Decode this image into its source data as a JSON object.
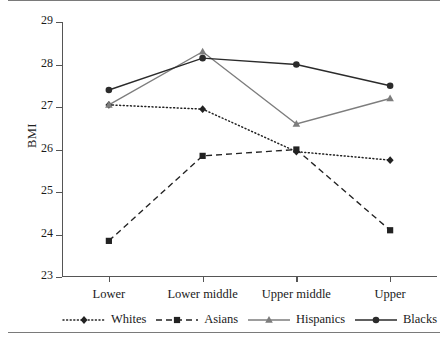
{
  "figure": {
    "ylabel": "BMI",
    "rules": [
      "top-rule",
      "bottom-rule"
    ]
  },
  "chart_data": {
    "type": "line",
    "title": "",
    "xlabel": "",
    "ylabel": "BMI",
    "categories": [
      "Lower",
      "Lower middle",
      "Upper middle",
      "Upper"
    ],
    "ylim": [
      23,
      29
    ],
    "yticks": [
      23,
      24,
      25,
      26,
      27,
      28,
      29
    ],
    "grid": false,
    "legend_position": "bottom",
    "series": [
      {
        "name": "Whites",
        "values": [
          27.05,
          26.95,
          25.95,
          25.75
        ],
        "linestyle": "dotted",
        "marker": "diamond",
        "color": "#222222"
      },
      {
        "name": "Asians",
        "values": [
          23.85,
          25.85,
          26.0,
          24.1
        ],
        "linestyle": "dashed",
        "marker": "square",
        "color": "#222222"
      },
      {
        "name": "Hispanics",
        "values": [
          27.05,
          28.3,
          26.6,
          27.2
        ],
        "linestyle": "solid",
        "marker": "triangle",
        "color": "#7d7d7d"
      },
      {
        "name": "Blacks",
        "values": [
          27.4,
          28.15,
          28.0,
          27.5
        ],
        "linestyle": "solid",
        "marker": "circle",
        "color": "#2b2b2b"
      }
    ]
  }
}
